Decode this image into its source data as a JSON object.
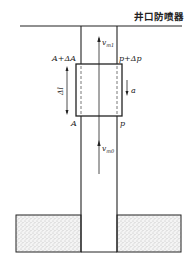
{
  "diagram": {
    "title": "井口防喷器",
    "labels": {
      "area_top": "A+ΔA",
      "pressure_top": "p+Δp",
      "area_bottom": "A",
      "pressure_bottom": "p",
      "length": "Δl",
      "acceleration": "a",
      "velocity_top": "v",
      "velocity_top_sub": "m1",
      "velocity_bottom": "v",
      "velocity_bottom_sub": "m0"
    },
    "colors": {
      "line": "#222222",
      "fill": "#ffffff",
      "sand": "#d9d9d9"
    }
  }
}
